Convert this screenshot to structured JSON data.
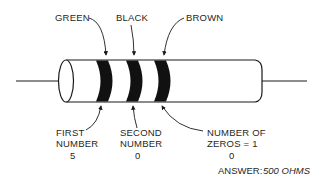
{
  "diagram": {
    "bands_top_labels": [
      {
        "id": "band1",
        "label": "GREEN"
      },
      {
        "id": "band2",
        "label": "BLACK"
      },
      {
        "id": "band3",
        "label": "BROWN"
      }
    ],
    "bottom_labels": [
      {
        "id": "band1",
        "line1": "FIRST",
        "line2": "NUMBER",
        "value": "5"
      },
      {
        "id": "band2",
        "line1": "SECOND",
        "line2": "NUMBER",
        "value": "0"
      },
      {
        "id": "band3",
        "line1": "NUMBER OF",
        "line2": "ZEROS = 1",
        "value": "0"
      }
    ],
    "answer": {
      "prefix": "ANSWER:",
      "value": "500 OHMS"
    },
    "colors": {
      "line": "#1a1a1a",
      "band": "#111111",
      "background": "#ffffff"
    }
  }
}
